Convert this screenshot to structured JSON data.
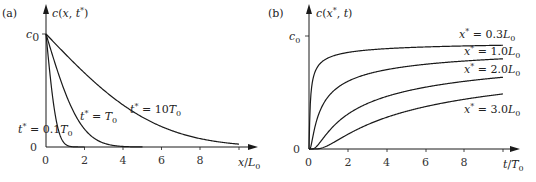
{
  "chart_data": [
    {
      "panel": "(a)",
      "type": "line",
      "title": "",
      "ylabel": "c(x, t*)",
      "xlabel": "x/L0",
      "y_ticks": [
        "0",
        "c0"
      ],
      "x_ticks": [
        "0",
        "2",
        "4",
        "6",
        "8"
      ],
      "xlim": [
        0,
        10
      ],
      "ylim": [
        0,
        1
      ],
      "grid": false,
      "model": "c = c0 * erfc(x / (2*sqrt(t*)))  (x in L0, t in T0, D = L0^2/T0)",
      "series": [
        {
          "name": "t* = 0.1T0",
          "t": 0.1,
          "x": [
            0,
            0.2,
            0.4,
            0.6,
            0.8,
            1.0,
            1.2,
            1.4
          ],
          "values": [
            1.0,
            0.65,
            0.37,
            0.18,
            0.07,
            0.025,
            0.007,
            0.0
          ]
        },
        {
          "name": "t* = T0",
          "t": 1.0,
          "x": [
            0,
            0.5,
            1,
            1.5,
            2,
            2.5,
            3,
            3.5,
            4
          ],
          "values": [
            1.0,
            0.72,
            0.48,
            0.29,
            0.16,
            0.08,
            0.03,
            0.01,
            0.0
          ]
        },
        {
          "name": "t* = 10T0",
          "t": 10.0,
          "x": [
            0,
            1,
            2,
            3,
            4,
            5,
            6,
            7,
            8,
            9,
            10
          ],
          "values": [
            1.0,
            0.82,
            0.65,
            0.5,
            0.37,
            0.27,
            0.18,
            0.12,
            0.07,
            0.04,
            0.025
          ]
        }
      ]
    },
    {
      "panel": "(b)",
      "type": "line",
      "title": "",
      "ylabel": "c(x*, t)",
      "xlabel": "t/T0",
      "y_ticks": [
        "0",
        "c0"
      ],
      "x_ticks": [
        "0",
        "2",
        "4",
        "6",
        "8"
      ],
      "xlim": [
        0,
        10
      ],
      "ylim": [
        0,
        1
      ],
      "grid": false,
      "model": "c = c0 * erfc(x* / (2*sqrt(t)))",
      "series": [
        {
          "name": "x* = 0.3L0",
          "xstar": 0.3,
          "t": [
            0,
            0.1,
            0.5,
            1,
            2,
            4,
            6,
            8,
            10
          ],
          "values": [
            0,
            0.5,
            0.76,
            0.83,
            0.88,
            0.92,
            0.93,
            0.94,
            0.95
          ]
        },
        {
          "name": "x* = 1.0L0",
          "xstar": 1.0,
          "t": [
            0,
            0.5,
            1,
            2,
            4,
            6,
            8,
            10
          ],
          "values": [
            0,
            0.32,
            0.48,
            0.62,
            0.72,
            0.77,
            0.8,
            0.82
          ]
        },
        {
          "name": "x* = 2.0L0",
          "xstar": 2.0,
          "t": [
            0,
            0.5,
            1,
            2,
            4,
            6,
            8,
            10
          ],
          "values": [
            0,
            0.05,
            0.16,
            0.32,
            0.48,
            0.56,
            0.62,
            0.65
          ]
        },
        {
          "name": "x* = 3.0L0",
          "xstar": 3.0,
          "t": [
            0,
            0.5,
            1,
            2,
            4,
            6,
            8,
            10
          ],
          "values": [
            0,
            0.0,
            0.03,
            0.13,
            0.29,
            0.39,
            0.45,
            0.5
          ]
        }
      ]
    }
  ],
  "labels": {
    "a": {
      "panel": "(a)",
      "ylabel": "c(x, t*)",
      "xlabel": "x/L0",
      "c0": "c0",
      "zero": "0",
      "ticks": [
        "0",
        "2",
        "4",
        "6",
        "8"
      ],
      "series": [
        "t* = 0.1T0",
        "t* = T0",
        "t* = 10T0"
      ]
    },
    "b": {
      "panel": "(b)",
      "ylabel": "c(x*, t)",
      "xlabel": "t/T0",
      "c0": "c0",
      "zero": "0",
      "ticks": [
        "0",
        "2",
        "4",
        "6",
        "8"
      ],
      "series": [
        "x* = 0.3L0",
        "x* = 1.0L0",
        "x* = 2.0L0",
        "x* = 3.0L0"
      ]
    }
  }
}
